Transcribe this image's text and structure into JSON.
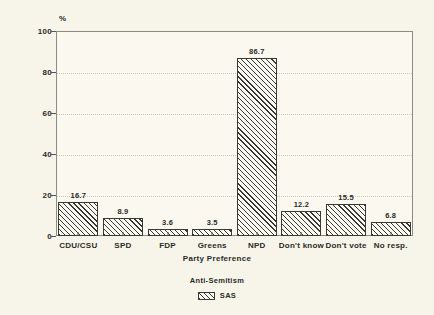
{
  "chart_data": {
    "type": "bar",
    "title": "",
    "subtitle": "",
    "xlabel": "Party Preference",
    "ylabel": "%",
    "ylim": [
      0,
      100
    ],
    "yticks": [
      0,
      20,
      40,
      60,
      80,
      100
    ],
    "ytick_labels": [
      "0",
      "20",
      "40",
      "60",
      "80",
      "100"
    ],
    "grid": "horizontal-dotted",
    "legend_position": "bottom-center",
    "legend_title": "Anti-Semitism",
    "categories": [
      "CDU/CSU",
      "SPD",
      "FDP",
      "Greens",
      "NPD",
      "Don't know",
      "Don't vote",
      "No resp."
    ],
    "values": [
      16.7,
      8.9,
      3.6,
      3.5,
      86.7,
      12.2,
      15.5,
      6.8
    ],
    "value_labels": [
      "16.7",
      "8.9",
      "3.6",
      "3.5",
      "86.7",
      "12.2",
      "15.5",
      "6.8"
    ],
    "series": [
      {
        "name": "SAS",
        "values": [
          16.7,
          8.9,
          3.6,
          3.5,
          86.7,
          12.2,
          15.5,
          6.8
        ]
      }
    ],
    "colors": {
      "background": "#f7f5ea",
      "plot_background": "#faf8ef",
      "axis": "#8d8c84",
      "bar_fill": "#fbfaf2",
      "bar_hatch": "#3a3a35",
      "gridline": "#c9c7bb",
      "text": "#2b2b28"
    }
  },
  "legend": {
    "title": "Anti-Semitism",
    "entries": [
      {
        "label": "SAS",
        "pattern": "diagonal-hatch"
      }
    ]
  },
  "axes": {
    "y_unit": "%",
    "x_title": "Party Preference"
  }
}
